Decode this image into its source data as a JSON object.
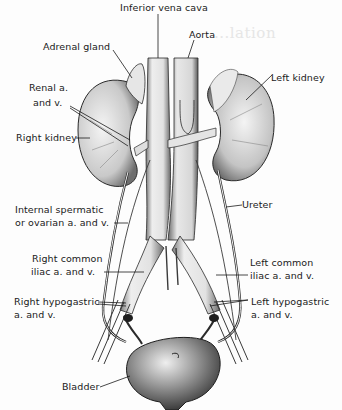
{
  "figure": {
    "ghost_text": "...lation",
    "colors": {
      "ink": "#1a1a1a",
      "organ_fill": "#e9e9e9",
      "organ_shade": "#8a8a8a",
      "vessel_fill": "#f2f2f2",
      "background": "#fdfdfd"
    }
  },
  "labels": {
    "ivc": "Inferior vena cava",
    "aorta": "Aorta",
    "adrenal": "Adrenal gland",
    "left_kidney": "Left kidney",
    "renal_line1": "Renal a.",
    "renal_line2": "and v.",
    "right_kidney": "Right kidney",
    "spermatic_line1": "Internal spermatic",
    "spermatic_line2": "or ovarian a. and v.",
    "ureter": "Ureter",
    "rci_line1": "Right common",
    "rci_line2": "iliac a. and v.",
    "lci_line1": "Left common",
    "lci_line2": "iliac a. and v.",
    "rhypo_line1": "Right hypogastric",
    "rhypo_line2": "a. and v.",
    "lhypo_line1": "Left hypogastric",
    "lhypo_line2": "a. and v.",
    "bladder": "Bladder"
  }
}
